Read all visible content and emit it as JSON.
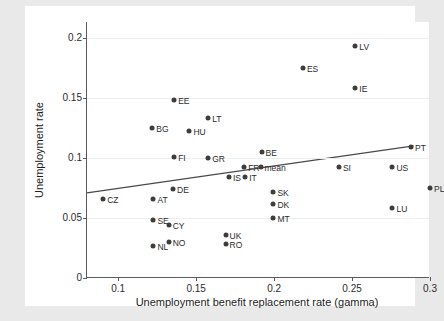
{
  "chart_data": {
    "type": "scatter",
    "title": "",
    "xlabel": "Unemployment benefit replacement rate (gamma)",
    "ylabel": "Unemployment rate",
    "xlim": [
      0.08,
      0.3
    ],
    "ylim": [
      0.0,
      0.213
    ],
    "xticks": [
      0.1,
      0.15,
      0.2,
      0.25,
      0.3
    ],
    "xticklabels": [
      "0.1",
      "0.15",
      "0.2",
      "0.25",
      "0.3"
    ],
    "yticks": [
      0,
      0.05,
      0.1,
      0.15,
      0.2
    ],
    "yticklabels": [
      "0",
      "0.05",
      "0.1",
      "0.15",
      "0.2"
    ],
    "grid": "horizontal",
    "legend": "none",
    "marker_color": "#3d3d3d",
    "line_color": "#4a4a4a",
    "background": "#ffffff",
    "figure_background": "#e9e9e9",
    "points": [
      {
        "label": "CZ",
        "x": 0.0904,
        "y": 0.0658,
        "label_pos": "right"
      },
      {
        "label": "AT",
        "x": 0.1226,
        "y": 0.0658,
        "label_pos": "right"
      },
      {
        "label": "DE",
        "x": 0.1352,
        "y": 0.0742,
        "label_pos": "right"
      },
      {
        "label": "SE",
        "x": 0.1226,
        "y": 0.0483,
        "label_pos": "right"
      },
      {
        "label": "CY",
        "x": 0.1324,
        "y": 0.0442,
        "label_pos": "right"
      },
      {
        "label": "NL",
        "x": 0.1226,
        "y": 0.0267,
        "label_pos": "right"
      },
      {
        "label": "NO",
        "x": 0.1324,
        "y": 0.03,
        "label_pos": "right"
      },
      {
        "label": "BG",
        "x": 0.1219,
        "y": 0.125,
        "label_pos": "right"
      },
      {
        "label": "EE",
        "x": 0.1359,
        "y": 0.1483,
        "label_pos": "right"
      },
      {
        "label": "HU",
        "x": 0.1457,
        "y": 0.1225,
        "label_pos": "right"
      },
      {
        "label": "FI",
        "x": 0.1359,
        "y": 0.1008,
        "label_pos": "right"
      },
      {
        "label": "LT",
        "x": 0.1577,
        "y": 0.1333,
        "label_pos": "right"
      },
      {
        "label": "GR",
        "x": 0.1577,
        "y": 0.1,
        "label_pos": "right"
      },
      {
        "label": "IS",
        "x": 0.171,
        "y": 0.0842,
        "label_pos": "right"
      },
      {
        "label": "UK",
        "x": 0.1689,
        "y": 0.0358,
        "label_pos": "right"
      },
      {
        "label": "RO",
        "x": 0.1689,
        "y": 0.0283,
        "label_pos": "right"
      },
      {
        "label": "FR",
        "x": 0.1808,
        "y": 0.0925,
        "label_pos": "right"
      },
      {
        "label": "IT",
        "x": 0.1815,
        "y": 0.0842,
        "label_pos": "right"
      },
      {
        "label": "mean",
        "x": 0.1913,
        "y": 0.0925,
        "label_pos": "right"
      },
      {
        "label": "BE",
        "x": 0.192,
        "y": 0.105,
        "label_pos": "right"
      },
      {
        "label": "SK",
        "x": 0.1996,
        "y": 0.0717,
        "label_pos": "right"
      },
      {
        "label": "DK",
        "x": 0.1996,
        "y": 0.0617,
        "label_pos": "right"
      },
      {
        "label": "MT",
        "x": 0.1996,
        "y": 0.05,
        "label_pos": "right"
      },
      {
        "label": "ES",
        "x": 0.2185,
        "y": 0.175,
        "label_pos": "right"
      },
      {
        "label": "LV",
        "x": 0.2521,
        "y": 0.1933,
        "label_pos": "right"
      },
      {
        "label": "IE",
        "x": 0.2521,
        "y": 0.1583,
        "label_pos": "right"
      },
      {
        "label": "SI",
        "x": 0.2416,
        "y": 0.0925,
        "label_pos": "right"
      },
      {
        "label": "US",
        "x": 0.2759,
        "y": 0.0925,
        "label_pos": "right"
      },
      {
        "label": "PT",
        "x": 0.2878,
        "y": 0.1092,
        "label_pos": "right"
      },
      {
        "label": "LU",
        "x": 0.2759,
        "y": 0.0583,
        "label_pos": "right"
      },
      {
        "label": "PL",
        "x": 0.3,
        "y": 0.075,
        "label_pos": "right"
      }
    ],
    "fit_line": {
      "x0": 0.08,
      "y0": 0.0708,
      "x1": 0.2895,
      "y1": 0.11
    }
  }
}
